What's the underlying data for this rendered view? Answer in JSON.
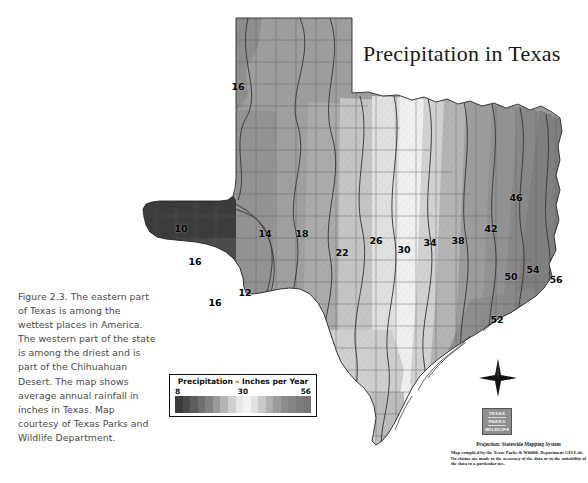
{
  "figure": {
    "caption": "Figure 2.3. The eastern part of Texas is among the wettest places in America. The western part of the state is among the driest and is part of the Chihuahuan Desert. The map shows average annual rainfall in inches in Texas. Map courtesy of Texas Parks and Wildlife Department."
  },
  "map": {
    "title": "Precipitation in Texas",
    "projection_note": "Projection: Statewide Mapping System",
    "disclaimer": "Map compiled by the Texas Parks & Wildlife Department GIS Lab. No claims are made to the accuracy of the data or to the suitability of the data to a particular use.",
    "logo": {
      "line1": "TEXAS",
      "line2": "PARKS",
      "line3": "WILDLIFE"
    },
    "compass_label": "N"
  },
  "legend": {
    "title": "Precipitation – Inches per Year",
    "min": "8",
    "mid": "30",
    "max": "56",
    "swatches": [
      "#3a3a3a",
      "#4a4a4a",
      "#5d5d5d",
      "#6f6f6f",
      "#828282",
      "#9a9a9a",
      "#b4b4b4",
      "#d0d0d0",
      "#e8e8e8",
      "#f4f4f4",
      "#e2e2e2",
      "#c9c9c9",
      "#b0b0b0",
      "#9c9c9c",
      "#8d8d8d",
      "#848484",
      "#7c7c7c",
      "#757575"
    ]
  },
  "chart_data": {
    "type": "map",
    "title": "Precipitation in Texas",
    "variable": "Average annual rainfall",
    "units": "inches per year",
    "value_range": [
      8,
      56
    ],
    "colormap": "grayscale (dark = dry, light = mid, dark = wet)",
    "isoline_labels": [
      {
        "value": 16,
        "x": 238,
        "y": 86,
        "region": "northwest panhandle"
      },
      {
        "value": 10,
        "x": 181,
        "y": 228,
        "region": "far west / Chihuahuan Desert"
      },
      {
        "value": 16,
        "x": 195,
        "y": 261,
        "region": "west (Davis Mountains)"
      },
      {
        "value": 16,
        "x": 215,
        "y": 302,
        "region": "Big Bend uplands"
      },
      {
        "value": 12,
        "x": 245,
        "y": 292,
        "region": "lower Big Bend"
      },
      {
        "value": 14,
        "x": 265,
        "y": 233,
        "region": "west Texas"
      },
      {
        "value": 18,
        "x": 302,
        "y": 233,
        "region": "west central"
      },
      {
        "value": 22,
        "x": 342,
        "y": 252,
        "region": "Edwards Plateau west"
      },
      {
        "value": 26,
        "x": 376,
        "y": 240,
        "region": "central plains"
      },
      {
        "value": 30,
        "x": 404,
        "y": 249,
        "region": "central Texas"
      },
      {
        "value": 34,
        "x": 430,
        "y": 242,
        "region": "north central"
      },
      {
        "value": 38,
        "x": 458,
        "y": 240,
        "region": "east central"
      },
      {
        "value": 42,
        "x": 491,
        "y": 228,
        "region": "east Texas"
      },
      {
        "value": 46,
        "x": 516,
        "y": 197,
        "region": "northeast Texas"
      },
      {
        "value": 50,
        "x": 511,
        "y": 276,
        "region": "southeast Texas"
      },
      {
        "value": 54,
        "x": 533,
        "y": 269,
        "region": "upper Gulf coast"
      },
      {
        "value": 56,
        "x": 556,
        "y": 279,
        "region": "far southeast / Sabine"
      },
      {
        "value": 52,
        "x": 497,
        "y": 319,
        "region": "Gulf coast"
      }
    ]
  }
}
